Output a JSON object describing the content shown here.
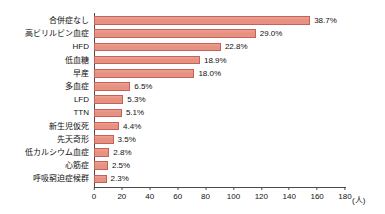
{
  "chart_data": {
    "type": "bar",
    "orientation": "horizontal",
    "title": "",
    "xlabel": "(人)",
    "ylabel": "",
    "xlim": [
      0,
      180
    ],
    "xticks": [
      0,
      20,
      40,
      60,
      80,
      100,
      120,
      140,
      160,
      180
    ],
    "grid": false,
    "legend": null,
    "unit_label": "(人)",
    "categories": [
      "合併症なし",
      "高ビリルビン血症",
      "HFD",
      "低血糖",
      "早産",
      "多血症",
      "LFD",
      "TTN",
      "新生児仮死",
      "先天奇形",
      "低カルシウム血症",
      "心筋症",
      "呼吸窮迫症候群"
    ],
    "values": [
      155,
      116,
      91,
      76,
      72,
      26,
      21,
      20,
      18,
      14,
      11,
      10,
      9
    ],
    "data_labels": [
      "38.7%",
      "29.0%",
      "22.8%",
      "18.9%",
      "18.0%",
      "6.5%",
      "5.3%",
      "5.1%",
      "4.4%",
      "3.5%",
      "2.8%",
      "2.5%",
      "2.3%"
    ],
    "percent_values": [
      38.7,
      29.0,
      22.8,
      18.9,
      18.0,
      6.5,
      5.3,
      5.1,
      4.4,
      3.5,
      2.8,
      2.5,
      2.3
    ],
    "colors": {
      "bar_fill": "#e8907f",
      "bar_border": "#c4625a",
      "axis": "#4a4a4a",
      "text": "#111111",
      "background": "#ffffff"
    }
  }
}
